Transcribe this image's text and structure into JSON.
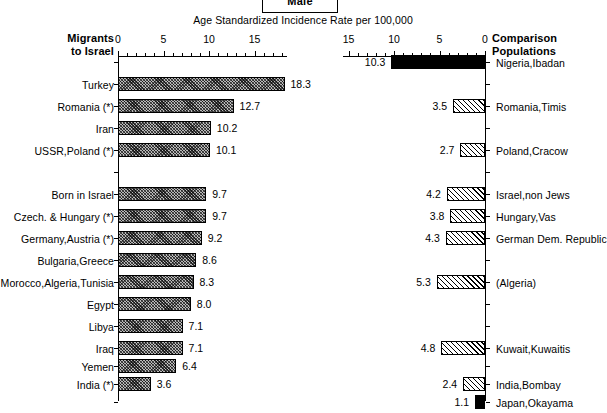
{
  "header": {
    "sex_label": "Male",
    "axis_title": "Age Standardized Incidence Rate per 100,000",
    "left_corner_line1": "Migrants",
    "left_corner_line2": "to Israel",
    "right_corner_line1": "Comparison",
    "right_corner_line2": "Populations"
  },
  "chart_data": {
    "type": "bar",
    "orientation": "horizontal-diverging",
    "title": "Male",
    "xlabel": "Age Standardized Incidence Rate per 100,000",
    "ylabel": "",
    "grid": false,
    "left_panel": {
      "name": "Migrants to Israel",
      "axis_ticks": [
        0,
        5,
        10,
        15
      ],
      "axis_tick_labels": [
        "0",
        "5",
        "10",
        "15"
      ],
      "xlim": [
        0,
        19.5
      ],
      "direction": "left-to-right",
      "categories": [
        "Turkey",
        "Romania (*)",
        "Iran",
        "USSR,Poland (*)",
        "",
        "Born in Israel",
        "Czech. & Hungary (*)",
        "Germany,Austria (*)",
        "Bulgaria,Greece",
        "Morocco,Algeria,Tunisia",
        "Egypt",
        "Libya",
        "Iraq",
        "Yemen",
        "India (*)"
      ],
      "values": [
        18.3,
        12.7,
        10.2,
        10.1,
        null,
        9.7,
        9.7,
        9.2,
        8.6,
        8.3,
        8.0,
        7.1,
        7.1,
        6.4,
        3.6
      ],
      "value_labels": [
        "18.3",
        "12.7",
        "10.2",
        "10.1",
        "",
        "9.7",
        "9.7",
        "9.2",
        "8.6",
        "8.3",
        "8.0",
        "7.1",
        "7.1",
        "6.4",
        "3.6"
      ],
      "fill": [
        "hatch-dense",
        "hatch-dense",
        "hatch-dense",
        "hatch-dense",
        null,
        "hatch-dense",
        "hatch-dense",
        "hatch-dense",
        "hatch-dense",
        "hatch-dense",
        "hatch-dense",
        "hatch-dense",
        "hatch-dense",
        "hatch-dense",
        "hatch-dense"
      ]
    },
    "right_panel": {
      "name": "Comparison Populations",
      "axis_ticks": [
        15,
        10,
        5,
        0
      ],
      "axis_tick_labels": [
        "15",
        "10",
        "5",
        "0"
      ],
      "xlim": [
        0,
        15
      ],
      "direction": "right-to-left",
      "categories": [
        "Nigeria,Ibadan",
        "",
        "Romania,Timis",
        "",
        "Poland,Cracow",
        "",
        "Israel,non Jews",
        "Hungary,Vas",
        "German Dem. Republic",
        "",
        "(Algeria)",
        "",
        "",
        "Kuwait,Kuwaitis",
        "",
        "India,Bombay",
        "Japan,Okayama"
      ],
      "values": [
        10.3,
        null,
        3.5,
        null,
        2.7,
        null,
        4.2,
        3.8,
        4.3,
        null,
        5.3,
        null,
        null,
        4.8,
        null,
        2.4,
        1.1
      ],
      "value_labels": [
        "10.3",
        "",
        "3.5",
        "",
        "2.7",
        "",
        "4.2",
        "3.8",
        "4.3",
        "",
        "5.3",
        "",
        "",
        "4.8",
        "",
        "2.4",
        "1.1"
      ],
      "fill": [
        "solid",
        null,
        "hatch-light",
        null,
        "hatch-light",
        null,
        "hatch-light",
        "hatch-light",
        "hatch-light",
        null,
        "hatch-light",
        null,
        null,
        "hatch-light",
        null,
        "hatch-light",
        "solid"
      ]
    },
    "rows": [
      {
        "y": 62,
        "left_label": "",
        "left_value": "",
        "right_label": "Nigeria,Ibadan",
        "right_value": "10.3"
      },
      {
        "y": 84,
        "left_label": "Turkey",
        "left_value": "18.3",
        "right_label": "",
        "right_value": ""
      },
      {
        "y": 106,
        "left_label": "Romania (*)",
        "left_value": "12.7",
        "right_label": "Romania,Timis",
        "right_value": "3.5"
      },
      {
        "y": 128,
        "left_label": "Iran",
        "left_value": "10.2",
        "right_label": "",
        "right_value": ""
      },
      {
        "y": 150,
        "left_label": "USSR,Poland (*)",
        "left_value": "10.1",
        "right_label": "Poland,Cracow",
        "right_value": "2.7"
      },
      {
        "y": 172,
        "left_label": "",
        "left_value": "",
        "right_label": "",
        "right_value": ""
      },
      {
        "y": 194,
        "left_label": "Born in Israel",
        "left_value": "9.7",
        "right_label": "Israel,non Jews",
        "right_value": "4.2"
      },
      {
        "y": 216,
        "left_label": "Czech. & Hungary (*)",
        "left_value": "9.7",
        "right_label": "Hungary,Vas",
        "right_value": "3.8"
      },
      {
        "y": 238,
        "left_label": "Germany,Austria (*)",
        "left_value": "9.2",
        "right_label": "German Dem. Republic",
        "right_value": "4.3"
      },
      {
        "y": 260,
        "left_label": "Bulgaria,Greece",
        "left_value": "8.6",
        "right_label": "",
        "right_value": ""
      },
      {
        "y": 282,
        "left_label": "Morocco,Algeria,Tunisia",
        "left_value": "8.3",
        "right_label": "(Algeria)",
        "right_value": "5.3"
      },
      {
        "y": 304,
        "left_label": "Egypt",
        "left_value": "8.0",
        "right_label": "",
        "right_value": ""
      },
      {
        "y": 326,
        "left_label": "Libya",
        "left_value": "7.1",
        "right_label": "",
        "right_value": ""
      },
      {
        "y": 348,
        "left_label": "Iraq",
        "left_value": "7.1",
        "right_label": "Kuwait,Kuwaitis",
        "right_value": "4.8"
      },
      {
        "y": 366,
        "left_label": "Yemen",
        "left_value": "6.4",
        "right_label": "",
        "right_value": ""
      },
      {
        "y": 384,
        "left_label": "India (*)",
        "left_value": "3.6",
        "right_label": "India,Bombay",
        "right_value": "2.4"
      },
      {
        "y": 402,
        "left_label": "",
        "left_value": "",
        "right_label": "Japan,Okayama",
        "right_value": "1.1"
      }
    ]
  }
}
